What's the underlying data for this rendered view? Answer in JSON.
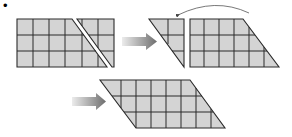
{
  "diagram": {
    "bullet": "•",
    "colors": {
      "fill": "#d4d4d4",
      "stroke": "#2a2a2a",
      "arrow_start": "#e8e8e8",
      "arrow_end": "#707070",
      "arc": "#555555"
    },
    "grid": {
      "columns": 6,
      "rows": 3
    },
    "steps": [
      {
        "id": "step-1",
        "label": "Rectangle cut along diagonal into two pieces"
      },
      {
        "id": "step-2",
        "label": "Triangle piece moved to opposite side"
      },
      {
        "id": "step-3",
        "label": "Resulting parallelogram"
      }
    ]
  }
}
